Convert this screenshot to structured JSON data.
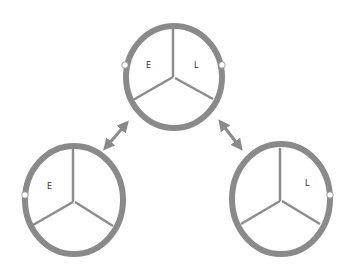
{
  "colors": {
    "ring": "#8a8a8a",
    "spoke": "#8c8c8c",
    "arrow": "#8a8a8a",
    "dot_fill": "#ffffff",
    "dot_stroke": "#8a8a8a",
    "label": "#333333"
  },
  "diagram": {
    "top_wheel": {
      "labels": {
        "left": "E",
        "right": "L"
      },
      "markers": [
        "left",
        "right"
      ]
    },
    "bottom_left_wheel": {
      "labels": {
        "left": "E"
      },
      "markers": [
        "left"
      ]
    },
    "bottom_right_wheel": {
      "labels": {
        "right": "L"
      },
      "markers": [
        "right"
      ]
    },
    "arrows": [
      {
        "from": "top_wheel",
        "to": "bottom_left_wheel",
        "type": "double-headed"
      },
      {
        "from": "top_wheel",
        "to": "bottom_right_wheel",
        "type": "double-headed"
      }
    ]
  }
}
